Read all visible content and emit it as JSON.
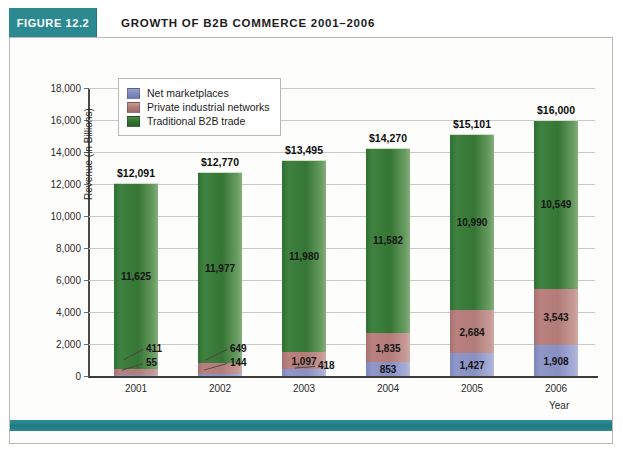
{
  "figure": {
    "badge": "FIGURE 12.2",
    "title": "GROWTH OF B2B COMMERCE 2001–2006",
    "accent_color": "#2b8a91",
    "frame_color": "#b9b9b4"
  },
  "chart_data": {
    "type": "bar",
    "subtype": "stacked",
    "title": "GROWTH OF B2B COMMERCE 2001–2006",
    "xlabel": "Year",
    "ylabel": "Revenue (in Billions)",
    "categories": [
      "2001",
      "2002",
      "2003",
      "2004",
      "2005",
      "2006"
    ],
    "ylim": [
      0,
      18000
    ],
    "ytick_labels": [
      "0",
      "2,000",
      "4,000",
      "6,000",
      "8,000",
      "10,000",
      "12,000",
      "14,000",
      "16,000",
      "18,000"
    ],
    "ytick_values": [
      0,
      2000,
      4000,
      6000,
      8000,
      10000,
      12000,
      14000,
      16000,
      18000
    ],
    "grid": true,
    "legend_position": "top-left",
    "series": [
      {
        "name": "Net marketplaces",
        "color": "#8f98c8",
        "values": [
          55,
          144,
          418,
          853,
          1427,
          1908
        ],
        "labels": [
          "55",
          "144",
          "418",
          "853",
          "1,427",
          "1,908"
        ]
      },
      {
        "name": "Private industrial networks",
        "color": "#b9817f",
        "values": [
          411,
          649,
          1097,
          1835,
          2684,
          3543
        ],
        "labels": [
          "411",
          "649",
          "1,097",
          "1,835",
          "2,684",
          "3,543"
        ]
      },
      {
        "name": "Traditional B2B trade",
        "color": "#2f7030",
        "values": [
          11625,
          11977,
          11980,
          11582,
          10990,
          10549
        ],
        "labels": [
          "11,625",
          "11,977",
          "11,980",
          "11,582",
          "10,990",
          "10,549"
        ]
      }
    ],
    "totals": [
      12091,
      12770,
      13495,
      14270,
      15101,
      16000
    ],
    "total_labels": [
      "$12,091",
      "$12,770",
      "$13,495",
      "$14,270",
      "$15,101",
      "$16,000"
    ]
  }
}
